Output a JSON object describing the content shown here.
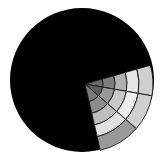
{
  "figure": {
    "disk": {
      "cx": 82,
      "cy": 80,
      "r": 72,
      "fill": "#000000"
    },
    "wedge": {
      "apex": {
        "x": 85,
        "y": 84
      },
      "sector_angles_deg": [
        -16,
        10,
        41,
        77
      ],
      "ring_radii": [
        0,
        18,
        30,
        42,
        54,
        68
      ],
      "line_color": "#1a1a1a",
      "cells": [
        [
          "#6a6a6a",
          "#7d7d7d",
          "#b0b0b0",
          "#e6e6e6",
          "#cfcfcf"
        ],
        [
          "#5e5e5e",
          "#999999",
          "#c8c8c8",
          "#eeeeee",
          "#d0d0d0"
        ],
        [
          "#7a7a7a",
          "#8c8c8c",
          "#bdbdbd",
          "#e2e2e2",
          "#9a9a9a"
        ]
      ]
    }
  }
}
